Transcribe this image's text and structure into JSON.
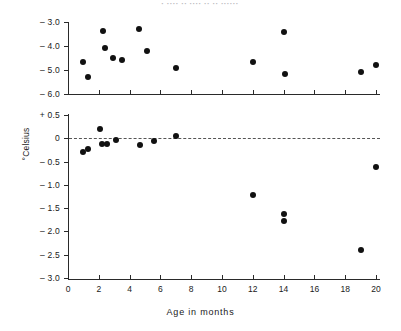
{
  "title_strip": "· ···· ·· ···· ·· ·· ······",
  "chart_data": {
    "type": "scatter",
    "title": "",
    "xlabel": "Age in months",
    "ylabel": "°Celsius",
    "panels": [
      {
        "name": "upper-panel",
        "ylim": [
          -6.0,
          -2.6
        ],
        "yticks": [
          -3.0,
          -4.0,
          -5.0,
          -6.0
        ],
        "ytick_labels": [
          "– 3.0",
          "– 4.0",
          "– 5.0",
          "– 6.0"
        ],
        "xlim": [
          0,
          20.8
        ],
        "xticks": [
          0,
          2,
          4,
          6,
          8,
          10,
          12,
          14,
          16,
          18,
          20
        ],
        "xtick_labels": [],
        "grid": false,
        "points": [
          {
            "x": 1.0,
            "y": -4.67
          },
          {
            "x": 1.3,
            "y": -5.28
          },
          {
            "x": 2.3,
            "y": -3.36
          },
          {
            "x": 2.4,
            "y": -4.07
          },
          {
            "x": 2.9,
            "y": -4.5
          },
          {
            "x": 3.5,
            "y": -4.58
          },
          {
            "x": 4.6,
            "y": -3.28
          },
          {
            "x": 5.1,
            "y": -4.22
          },
          {
            "x": 7.0,
            "y": -4.9
          },
          {
            "x": 12.0,
            "y": -4.66
          },
          {
            "x": 14.0,
            "y": -3.43
          },
          {
            "x": 14.1,
            "y": -5.17
          },
          {
            "x": 19.0,
            "y": -5.1
          },
          {
            "x": 20.0,
            "y": -4.78
          }
        ]
      },
      {
        "name": "lower-panel",
        "ylim": [
          -3.0,
          0.5
        ],
        "yticks": [
          0.5,
          0,
          -0.5,
          -1.0,
          -1.5,
          -2.0,
          -2.5,
          -3.0
        ],
        "ytick_labels": [
          "+ 0.5",
          "0",
          "– 0.5",
          "– 1.0",
          "– 1.5",
          "– 2.0",
          "– 2.5",
          "– 3.0"
        ],
        "xlim": [
          0,
          20.8
        ],
        "xticks": [
          0,
          2,
          4,
          6,
          8,
          10,
          12,
          14,
          16,
          18,
          20
        ],
        "xtick_labels": [
          "0",
          "2",
          "4",
          "6",
          "8",
          "10",
          "12",
          "14",
          "16",
          "18",
          "20"
        ],
        "grid": false,
        "reference_line": {
          "y": 0,
          "style": "dashed"
        },
        "points": [
          {
            "x": 1.0,
            "y": -0.3
          },
          {
            "x": 1.3,
            "y": -0.22
          },
          {
            "x": 2.1,
            "y": 0.2
          },
          {
            "x": 2.2,
            "y": -0.13
          },
          {
            "x": 2.5,
            "y": -0.12
          },
          {
            "x": 3.1,
            "y": -0.03
          },
          {
            "x": 4.7,
            "y": -0.15
          },
          {
            "x": 5.6,
            "y": -0.06
          },
          {
            "x": 7.0,
            "y": 0.04
          },
          {
            "x": 12.0,
            "y": -1.21
          },
          {
            "x": 14.0,
            "y": -1.63
          },
          {
            "x": 14.0,
            "y": -1.78
          },
          {
            "x": 19.0,
            "y": -2.4
          },
          {
            "x": 20.0,
            "y": -0.61
          }
        ]
      }
    ]
  }
}
